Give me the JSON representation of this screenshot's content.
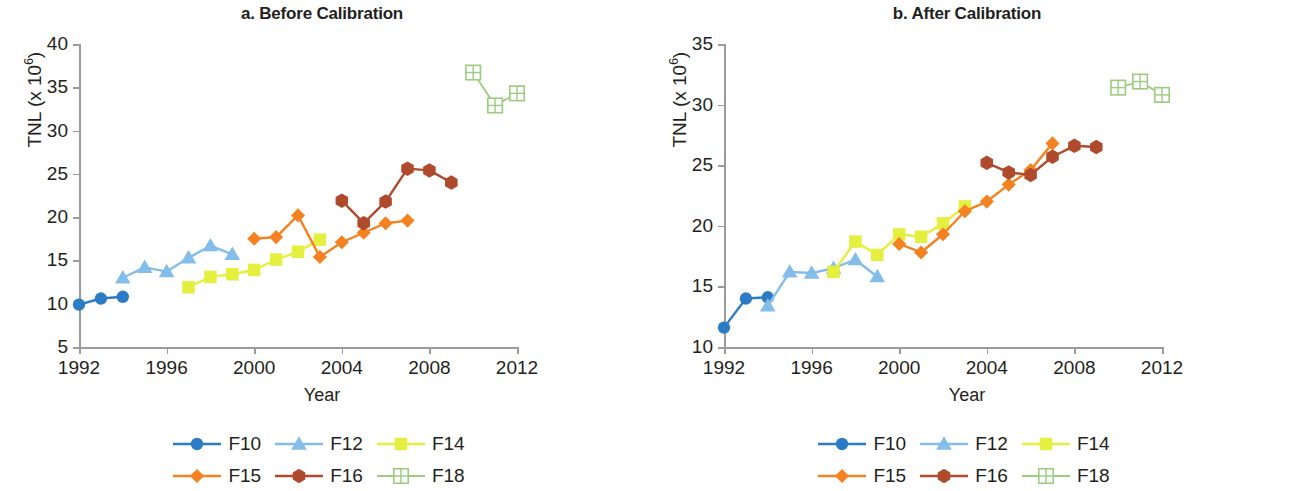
{
  "figure": {
    "x_axis_title": "Year",
    "y_axis_title_main": "TNL (x 10",
    "y_axis_title_sup": "6",
    "y_axis_title_close": ")"
  },
  "legend": {
    "rows": [
      [
        {
          "key": "F10",
          "label": "F10",
          "color": "#2b7cc4",
          "marker": "circle"
        },
        {
          "key": "F12",
          "label": "F12",
          "color": "#83bdea",
          "marker": "triangle"
        },
        {
          "key": "F14",
          "label": "F14",
          "color": "#e4ef3f",
          "marker": "square"
        }
      ],
      [
        {
          "key": "F15",
          "label": "F15",
          "color": "#f58220",
          "marker": "diamond"
        },
        {
          "key": "F16",
          "label": "F16",
          "color": "#b04a2c",
          "marker": "hexagon"
        },
        {
          "key": "F18",
          "label": "F18",
          "color": "#9ccb7e",
          "marker": "gridsquare"
        }
      ]
    ]
  },
  "chart_data": [
    {
      "id": "panel_a",
      "type": "line",
      "title": "a. Before Calibration",
      "xlabel": "Year",
      "ylabel": "TNL (x 10^6)",
      "xlim": [
        1992,
        2012
      ],
      "ylim": [
        5,
        40
      ],
      "xticks": [
        1992,
        1996,
        2000,
        2004,
        2008,
        2012
      ],
      "yticks": [
        5,
        10,
        15,
        20,
        25,
        30,
        35,
        40
      ],
      "grid": false,
      "legend_position": "bottom",
      "series": [
        {
          "name": "F10",
          "color": "#2b7cc4",
          "marker": "circle",
          "x": [
            1992,
            1993,
            1994
          ],
          "y": [
            9.9,
            10.6,
            10.8
          ]
        },
        {
          "name": "F12",
          "color": "#83bdea",
          "marker": "triangle",
          "x": [
            1994,
            1995,
            1996,
            1997,
            1998,
            1999
          ],
          "y": [
            13.0,
            14.2,
            13.7,
            15.3,
            16.7,
            15.7
          ]
        },
        {
          "name": "F14",
          "color": "#e4ef3f",
          "marker": "square",
          "x": [
            1997,
            1998,
            1999,
            2000,
            2001,
            2002,
            2003
          ],
          "y": [
            11.9,
            13.1,
            13.4,
            13.9,
            15.1,
            16.0,
            17.4
          ]
        },
        {
          "name": "F15",
          "color": "#f58220",
          "marker": "diamond",
          "x": [
            2000,
            2001,
            2002,
            2003,
            2004,
            2005,
            2006,
            2007
          ],
          "y": [
            17.5,
            17.7,
            20.2,
            15.4,
            17.1,
            18.2,
            19.3,
            19.6
          ]
        },
        {
          "name": "F16",
          "color": "#b04a2c",
          "marker": "hexagon",
          "x": [
            2004,
            2005,
            2006,
            2007,
            2008,
            2009
          ],
          "y": [
            21.9,
            19.3,
            21.8,
            25.6,
            25.4,
            24.0
          ]
        },
        {
          "name": "F18",
          "color": "#9ccb7e",
          "marker": "gridsquare",
          "x": [
            2010,
            2011,
            2012
          ],
          "y": [
            36.7,
            32.9,
            34.3
          ]
        }
      ]
    },
    {
      "id": "panel_b",
      "type": "line",
      "title": "b. After Calibration",
      "xlabel": "Year",
      "ylabel": "TNL (x 10^6)",
      "xlim": [
        1992,
        2012
      ],
      "ylim": [
        10,
        35
      ],
      "xticks": [
        1992,
        1996,
        2000,
        2004,
        2008,
        2012
      ],
      "yticks": [
        10,
        15,
        20,
        25,
        30,
        35
      ],
      "grid": false,
      "legend_position": "bottom",
      "series": [
        {
          "name": "F10",
          "color": "#2b7cc4",
          "marker": "circle",
          "x": [
            1992,
            1993,
            1994
          ],
          "y": [
            11.6,
            14.0,
            14.1
          ]
        },
        {
          "name": "F12",
          "color": "#83bdea",
          "marker": "triangle",
          "x": [
            1994,
            1995,
            1996,
            1997,
            1998,
            1999
          ],
          "y": [
            13.4,
            16.2,
            16.1,
            16.5,
            17.2,
            15.8
          ]
        },
        {
          "name": "F14",
          "color": "#e4ef3f",
          "marker": "square",
          "x": [
            1997,
            1998,
            1999,
            2000,
            2001,
            2002,
            2003
          ],
          "y": [
            16.2,
            18.7,
            17.6,
            19.3,
            19.1,
            20.2,
            21.6
          ]
        },
        {
          "name": "F15",
          "color": "#f58220",
          "marker": "diamond",
          "x": [
            2000,
            2001,
            2002,
            2003,
            2004,
            2005,
            2006,
            2007
          ],
          "y": [
            18.5,
            17.8,
            19.3,
            21.2,
            22.0,
            23.4,
            24.6,
            26.8
          ]
        },
        {
          "name": "F16",
          "color": "#b04a2c",
          "marker": "hexagon",
          "x": [
            2004,
            2005,
            2006,
            2007,
            2008,
            2009
          ],
          "y": [
            25.2,
            24.4,
            24.2,
            25.7,
            26.6,
            26.5
          ]
        },
        {
          "name": "F18",
          "color": "#9ccb7e",
          "marker": "gridsquare",
          "x": [
            2010,
            2011,
            2012
          ],
          "y": [
            31.4,
            31.9,
            30.8
          ]
        }
      ]
    }
  ]
}
